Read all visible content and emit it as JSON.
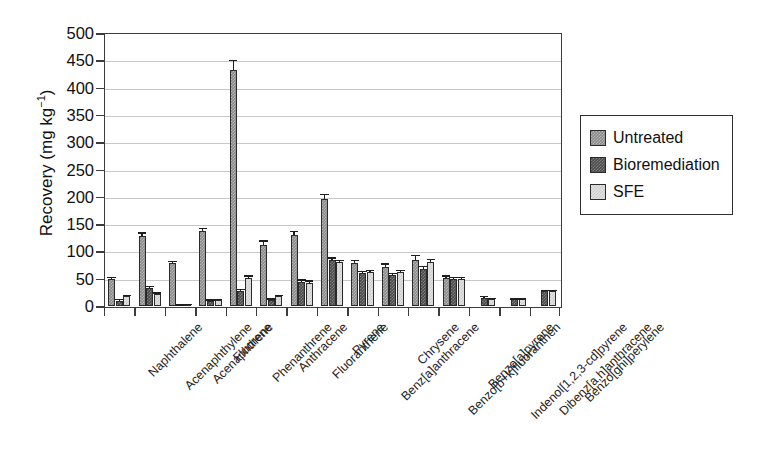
{
  "chart_data": {
    "type": "bar",
    "title": "",
    "xlabel": "",
    "ylabel": "Recovery (mg kg-1)",
    "ylabel_base": "Recovery (mg kg",
    "ylabel_sup": "−1",
    "ylabel_tail": ")",
    "ylim": [
      0,
      500
    ],
    "ytick_step": 50,
    "yticks": [
      0,
      50,
      100,
      150,
      200,
      250,
      300,
      350,
      400,
      450,
      500
    ],
    "ytick_labels": [
      "0",
      "50",
      "100",
      "150",
      "200",
      "250",
      "300",
      "350",
      "400",
      "450",
      "500"
    ],
    "grid": true,
    "grid_axis": "y",
    "legend_position": "right",
    "categories": [
      "Naphthalene",
      "Acenaphthylene",
      "Acenaphthene",
      "Fluorene",
      "Phenanthrene",
      "Anthracene",
      "Fluoranthene",
      "Pyrene",
      "Benz[a]anthracene",
      "Chrysene",
      "Benzo[b+k]fluoranthen",
      "Benzo[a]pyrene",
      "Indenol[1,2,3-cd]pyrene",
      "Dibenz[a,h]anthracene",
      "Benzo[ghi]perylene"
    ],
    "series": [
      {
        "name": "Untreated",
        "color": "#8a8a8a",
        "values": [
          50,
          128,
          78,
          137,
          433,
          112,
          130,
          196,
          78,
          72,
          85,
          52,
          0,
          0,
          0
        ],
        "errors": [
          4,
          7,
          5,
          6,
          18,
          8,
          7,
          9,
          6,
          6,
          9,
          4,
          0,
          0,
          0
        ]
      },
      {
        "name": "Bioremediation",
        "color": "#4a4a4a",
        "values": [
          10,
          33,
          2,
          10,
          27,
          11,
          44,
          84,
          60,
          57,
          68,
          50,
          15,
          12,
          27
        ],
        "errors": [
          3,
          4,
          1,
          2,
          4,
          3,
          5,
          5,
          4,
          4,
          6,
          3,
          3,
          2,
          3
        ]
      },
      {
        "name": "SFE",
        "color": "#e2e2e2",
        "values": [
          18,
          22,
          3,
          11,
          52,
          18,
          42,
          80,
          62,
          62,
          80,
          50,
          13,
          12,
          27
        ],
        "errors": [
          2,
          3,
          1,
          2,
          4,
          3,
          5,
          5,
          4,
          4,
          6,
          3,
          2,
          2,
          3
        ]
      }
    ]
  },
  "legend": {
    "items": [
      {
        "label": "Untreated"
      },
      {
        "label": "Bioremediation"
      },
      {
        "label": "SFE"
      }
    ]
  }
}
